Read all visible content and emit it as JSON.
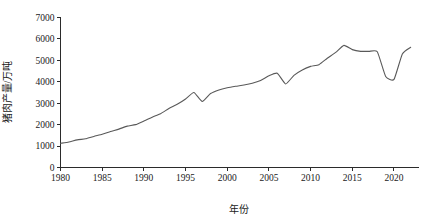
{
  "chart_data": {
    "type": "line",
    "title": "",
    "xlabel": "年份",
    "ylabel": "猪肉产量/万吨",
    "xlim": [
      1980,
      2023
    ],
    "ylim": [
      0,
      7000
    ],
    "grid": false,
    "legend": false,
    "legend_position": "none",
    "line_color": "#595959",
    "axis_color": "#2b2b2b",
    "xticks": [
      1980,
      1985,
      1990,
      1995,
      2000,
      2005,
      2010,
      2015,
      2020
    ],
    "xticklabels": [
      "1980",
      "1985",
      "1990",
      "1995",
      "2000",
      "2005",
      "2010",
      "2015",
      "2020"
    ],
    "yticks": [
      0,
      1000,
      2000,
      3000,
      4000,
      5000,
      6000,
      7000
    ],
    "yticklabels": [
      "0",
      "1000",
      "2000",
      "3000",
      "4000",
      "5000",
      "6000",
      "7000"
    ],
    "series": [
      {
        "name": "猪肉产量",
        "x": [
          1980,
          1981,
          1982,
          1983,
          1984,
          1985,
          1986,
          1987,
          1988,
          1989,
          1990,
          1991,
          1992,
          1993,
          1994,
          1995,
          1996,
          1997,
          1998,
          1999,
          2000,
          2001,
          2002,
          2003,
          2004,
          2005,
          2006,
          2007,
          2008,
          2009,
          2010,
          2011,
          2012,
          2013,
          2014,
          2015,
          2016,
          2017,
          2018,
          2019,
          2020,
          2021,
          2022
        ],
        "values": [
          1130,
          1190,
          1290,
          1340,
          1450,
          1550,
          1680,
          1790,
          1930,
          2000,
          2170,
          2350,
          2510,
          2750,
          2950,
          3200,
          3500,
          3080,
          3450,
          3620,
          3720,
          3790,
          3850,
          3930,
          4060,
          4280,
          4400,
          3900,
          4300,
          4550,
          4720,
          4800,
          5100,
          5370,
          5700,
          5500,
          5420,
          5420,
          5400,
          4250,
          4110,
          5300,
          5610
        ]
      }
    ]
  },
  "axis": {
    "x_title": "年份",
    "y_title": "猪肉产量/万吨"
  },
  "ticks": {
    "x_labels": [
      "1980",
      "1985",
      "1990",
      "1995",
      "2000",
      "2005",
      "2010",
      "2015",
      "2020"
    ],
    "y_labels": [
      "0",
      "1000",
      "2000",
      "3000",
      "4000",
      "5000",
      "6000",
      "7000"
    ]
  },
  "colors": {
    "line": "#595959",
    "axis": "#2b2b2b",
    "background": "#ffffff",
    "text": "#1a1a1a"
  }
}
